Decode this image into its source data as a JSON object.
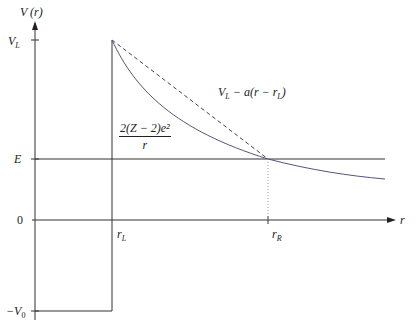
{
  "diagram": {
    "axes": {
      "y_label": "V (r)",
      "x_label": "r",
      "y_ticks": [
        "V_L",
        "E",
        "0",
        "-V_0"
      ],
      "x_ticks": [
        "r_L",
        "r_R"
      ]
    },
    "labels": {
      "y_axis": "V (r)",
      "x_axis": "r",
      "VL": "V",
      "VL_sub": "L",
      "E": "E",
      "zero": "0",
      "negV0": "−V",
      "negV0_sub": "0",
      "rL": "r",
      "rL_sub": "L",
      "rR": "r",
      "rR_sub": "R",
      "linear_approx": "V_L − a(r − r_L)",
      "linear_approx_main": "V",
      "linear_approx_sub1": "L",
      "linear_approx_mid": " − a(r − r",
      "linear_approx_sub2": "L",
      "linear_approx_end": ")",
      "coulomb_num": "2(Z − 2)e²",
      "coulomb_den": "r"
    },
    "colors": {
      "line": "#333333",
      "curve": "#555577",
      "dotted": "#999999"
    }
  }
}
